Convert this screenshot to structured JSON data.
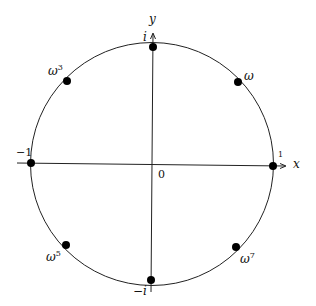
{
  "diagram": {
    "axes": {
      "x_label": "x",
      "y_label": "y",
      "origin_label": "0"
    },
    "points": [
      {
        "name": "1",
        "label": "1",
        "angle_deg": 0
      },
      {
        "name": "omega",
        "label": "ω",
        "sup": "",
        "angle_deg": 45
      },
      {
        "name": "i",
        "label": "i",
        "angle_deg": 90
      },
      {
        "name": "omega3",
        "label": "ω",
        "sup": "3",
        "angle_deg": 135
      },
      {
        "name": "minus-1",
        "label": "−1",
        "angle_deg": 180
      },
      {
        "name": "omega5",
        "label": "ω",
        "sup": "5",
        "angle_deg": 225
      },
      {
        "name": "minus-i",
        "label": "−i",
        "angle_deg": 270
      },
      {
        "name": "omega7",
        "label": "ω",
        "sup": "7",
        "angle_deg": 315
      }
    ],
    "colors": {
      "line": "#222222",
      "point": "#000000"
    }
  }
}
